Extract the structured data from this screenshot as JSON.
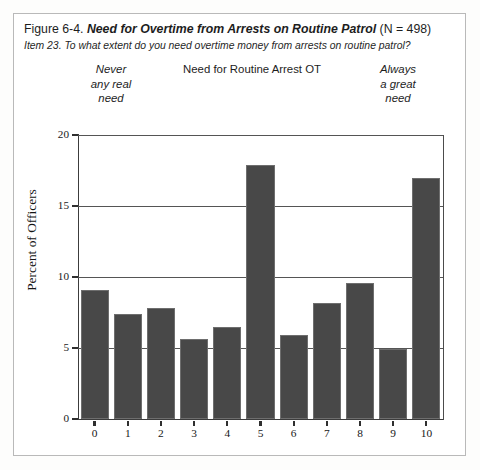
{
  "figure": {
    "number": "Figure 6-4.",
    "title": "Need for Overtime from Arrests on Routine Patrol",
    "n_label": "(N = 498)",
    "item_text": "Item 23. To what extent do you need overtime money from arrests on routine patrol?"
  },
  "anchors": {
    "left": "Never\nany real\nneed",
    "left_line1": "Never",
    "left_line2": "any real",
    "left_line3": "need",
    "center": "Need for Routine Arrest OT",
    "right_line1": "Always",
    "right_line2": "a great",
    "right_line3": "need"
  },
  "colors": {
    "bar_fill": "#484848",
    "bar_edge": "#6e6e6e",
    "axis": "#3c3c3c",
    "gridline": "#555555",
    "frame": "#b9b9b9",
    "page_background": "#ffffff"
  },
  "chart_data": {
    "type": "bar",
    "title": "Need for Routine Arrest OT",
    "xlabel": "",
    "ylabel": "Percent of Officers",
    "categories": [
      "0",
      "1",
      "2",
      "3",
      "4",
      "5",
      "6",
      "7",
      "8",
      "9",
      "10"
    ],
    "values": [
      9.1,
      7.4,
      7.8,
      5.6,
      6.5,
      17.9,
      5.9,
      8.2,
      9.6,
      4.9,
      17.0
    ],
    "ylim": [
      0,
      20
    ],
    "yticks": [
      0,
      5,
      10,
      15,
      20
    ],
    "ytick_labels": [
      "0",
      "5",
      "10",
      "15",
      "20"
    ],
    "grid": true,
    "grid_axis": "y",
    "legend": false,
    "scale_anchor_low": "Never any real need",
    "scale_anchor_high": "Always a great need"
  }
}
